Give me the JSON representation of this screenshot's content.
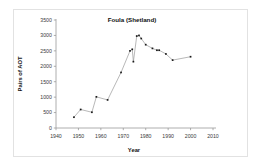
{
  "chart_data": {
    "type": "line",
    "title": "Foula (Shetland)",
    "xlabel": "Year",
    "ylabel": "Pairs of AOT",
    "xlim": [
      1940,
      2010
    ],
    "ylim": [
      0,
      3500
    ],
    "xticks": [
      1940,
      1950,
      1960,
      1970,
      1980,
      1990,
      2000,
      2010
    ],
    "xtick_labels": [
      "1940",
      "1950",
      "1960",
      "1970",
      "1980",
      "1990",
      "2000",
      "2010"
    ],
    "yticks": [
      0,
      500,
      1000,
      1500,
      2000,
      2500,
      3000,
      3500
    ],
    "ytick_labels": [
      "0",
      "500",
      "1000",
      "1500",
      "2000",
      "2500",
      "3000",
      "3500"
    ],
    "grid": false,
    "legend": false,
    "marker": "square",
    "line_color": "#9a9a9a",
    "marker_color": "#1a1a1a",
    "series": [
      {
        "name": "Foula (Shetland)",
        "x": [
          1948,
          1951,
          1956,
          1958,
          1963,
          1969,
          1973,
          1974,
          1974.5,
          1976,
          1977,
          1978,
          1980,
          1983,
          1985,
          1986,
          1989,
          1992,
          2000
        ],
        "values": [
          350,
          600,
          510,
          1010,
          910,
          1800,
          2500,
          2550,
          2150,
          2980,
          3000,
          2900,
          2700,
          2580,
          2520,
          2520,
          2400,
          2200,
          2310
        ]
      }
    ]
  },
  "figure": {
    "title_text": "Foula (Shetland)",
    "x_axis_title": "Year",
    "y_axis_title": "Pairs of AOT"
  }
}
